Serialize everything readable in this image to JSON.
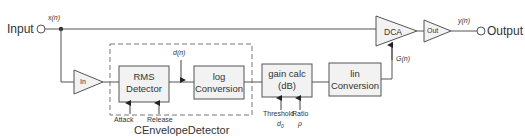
{
  "diagram": {
    "input_label": "Input",
    "output_label": "Output",
    "signals": {
      "x": "x(n)",
      "y": "y(n)",
      "d": "d(n)",
      "G": "G(n)"
    },
    "blocks": {
      "in_amp": "In",
      "rms_line1": "RMS",
      "rms_line2": "Detector",
      "log_line1": "log",
      "log_line2": "Conversion",
      "gain_line1": "gain calc",
      "gain_line2": "(dB)",
      "lin_line1": "lin",
      "lin_line2": "Conversion",
      "dca": "DCA",
      "out_amp": "Out"
    },
    "controls": {
      "attack": "Attack",
      "release": "Release",
      "threshold": "Threshold",
      "threshold_symbol": "d",
      "threshold_sub": "0",
      "ratio": "Ratio",
      "ratio_symbol": "ρ"
    },
    "group_label": "CEnvelopeDetector",
    "colors": {
      "line": "#444444",
      "box_fill": "#f2f2f2",
      "dashed": "#666666"
    }
  }
}
